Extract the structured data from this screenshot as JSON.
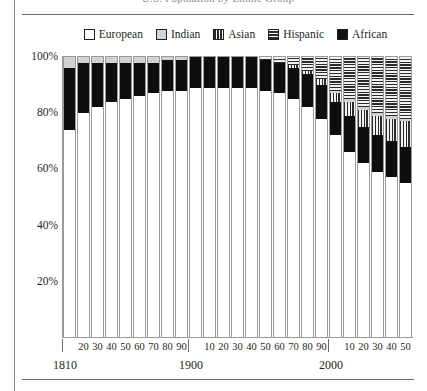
{
  "figure": {
    "title_partial": "U.S. Population by Ethnic Group",
    "y_axis": {
      "ticks": [
        "100%",
        "80%",
        "60%",
        "40%",
        "20%"
      ],
      "tick_values": [
        100,
        80,
        60,
        40,
        20
      ],
      "max": 100,
      "min": 0
    },
    "x_axis": {
      "decade_labels": [
        "20",
        "30",
        "40",
        "50",
        "60",
        "70",
        "80",
        "90",
        "10",
        "20",
        "30",
        "40",
        "50",
        "60",
        "70",
        "80",
        "90",
        "10",
        "20",
        "30",
        "40",
        "50"
      ],
      "era_labels": [
        "1810",
        "1900",
        "2000"
      ]
    }
  },
  "legend": {
    "position": "top-center",
    "items": [
      {
        "label": "European",
        "pattern": "solid-white",
        "color": "#ffffff",
        "swatch_class": "sw-european"
      },
      {
        "label": "Indian",
        "pattern": "solid-lightgray",
        "color": "#d4d4d4",
        "swatch_class": "sw-indian"
      },
      {
        "label": "Asian",
        "pattern": "vertical-stripes",
        "color": "#2b2b2b",
        "swatch_class": "sw-asian"
      },
      {
        "label": "Hispanic",
        "pattern": "horizontal-stripes",
        "color": "#2b2b2b",
        "swatch_class": "sw-hispanic"
      },
      {
        "label": "African",
        "pattern": "solid-black",
        "color": "#111111",
        "swatch_class": "sw-african"
      }
    ]
  },
  "chart_data": {
    "type": "bar",
    "subtype": "100% stacked column",
    "title": "U.S. Population by Ethnic Group",
    "xlabel": "",
    "ylabel": "",
    "ylim": [
      0,
      100
    ],
    "grid": false,
    "legend_position": "top-center",
    "stack_order_bottom_to_top": [
      "European",
      "African",
      "Asian",
      "Indian",
      "Hispanic"
    ],
    "categories": [
      "1810",
      "1820",
      "1830",
      "1840",
      "1850",
      "1860",
      "1870",
      "1880",
      "1890",
      "1900",
      "1910",
      "1920",
      "1930",
      "1940",
      "1950",
      "1960",
      "1970",
      "1980",
      "1990",
      "2000",
      "2010",
      "2020",
      "2030",
      "2040",
      "2050"
    ],
    "series": [
      {
        "name": "European",
        "pattern": "solid-white",
        "values": [
          74,
          80,
          82,
          84,
          85,
          86,
          87,
          88,
          88,
          89,
          89,
          89,
          89,
          89,
          88,
          87,
          85,
          82,
          78,
          72,
          66,
          62,
          59,
          57,
          55
        ]
      },
      {
        "name": "African",
        "pattern": "solid-black",
        "values": [
          22,
          18,
          16,
          14,
          13,
          12,
          11,
          11,
          11,
          11,
          11,
          11,
          11,
          11,
          11,
          11,
          11,
          12,
          12,
          12,
          13,
          13,
          13,
          13,
          13
        ]
      },
      {
        "name": "Asian",
        "pattern": "vertical-stripes",
        "values": [
          0,
          0,
          0,
          0,
          0,
          0,
          0,
          0,
          0,
          0,
          0,
          0,
          0,
          0,
          0,
          0,
          1,
          1,
          2,
          3,
          5,
          6,
          7,
          8,
          9
        ]
      },
      {
        "name": "Indian",
        "pattern": "solid-lightgray",
        "values": [
          4,
          2,
          2,
          2,
          2,
          2,
          2,
          1,
          1,
          0,
          0,
          0,
          0,
          0,
          0,
          0,
          0,
          0,
          0,
          1,
          1,
          1,
          1,
          1,
          1
        ]
      },
      {
        "name": "Hispanic",
        "pattern": "horizontal-stripes",
        "values": [
          0,
          0,
          0,
          0,
          0,
          0,
          0,
          0,
          0,
          0,
          0,
          0,
          0,
          0,
          1,
          2,
          3,
          5,
          8,
          12,
          15,
          18,
          20,
          21,
          22
        ]
      }
    ]
  }
}
